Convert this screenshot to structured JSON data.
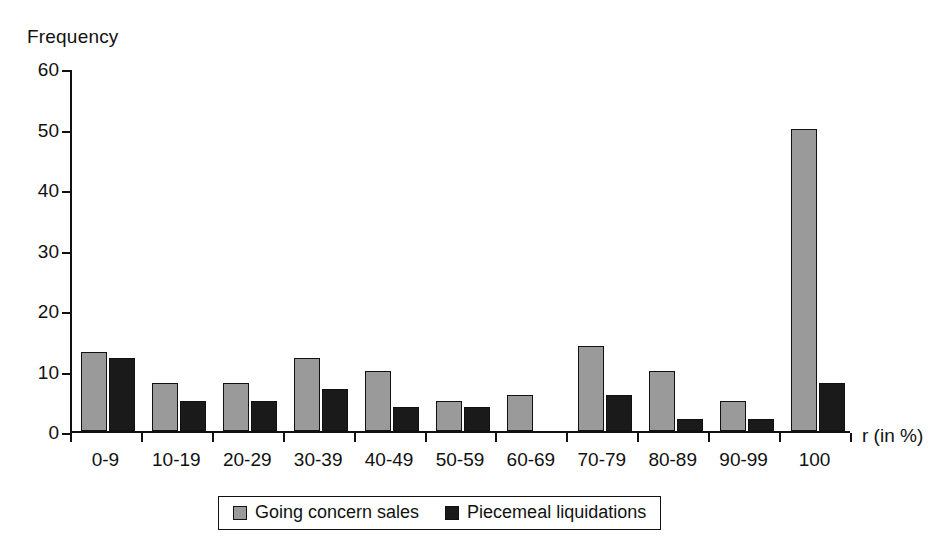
{
  "chart_data": {
    "type": "bar",
    "title": "",
    "xlabel": "r (in %)",
    "ylabel": "Frequency",
    "ylim": [
      0,
      60
    ],
    "yticks": [
      0,
      10,
      20,
      30,
      40,
      50,
      60
    ],
    "grid": false,
    "legend_position": "bottom",
    "categories": [
      "0-9",
      "10-19",
      "20-29",
      "30-39",
      "40-49",
      "50-59",
      "60-69",
      "70-79",
      "80-89",
      "90-99",
      "100"
    ],
    "series": [
      {
        "name": "Going concern sales",
        "color": "#9a9a9a",
        "values": [
          13,
          8,
          8,
          12,
          10,
          5,
          6,
          14,
          10,
          5,
          50
        ]
      },
      {
        "name": "Piecemeal liquidations",
        "color": "#1a1a1a",
        "values": [
          12,
          5,
          5,
          7,
          4,
          4,
          0,
          6,
          2,
          2,
          8
        ]
      }
    ]
  },
  "legend": {
    "entries": [
      {
        "label": "Going concern sales"
      },
      {
        "label": "Piecemeal liquidations"
      }
    ]
  },
  "colors": {
    "series_going_concern": "#9a9a9a",
    "series_piecemeal": "#1a1a1a",
    "axis": "#111111",
    "background": "#ffffff"
  }
}
